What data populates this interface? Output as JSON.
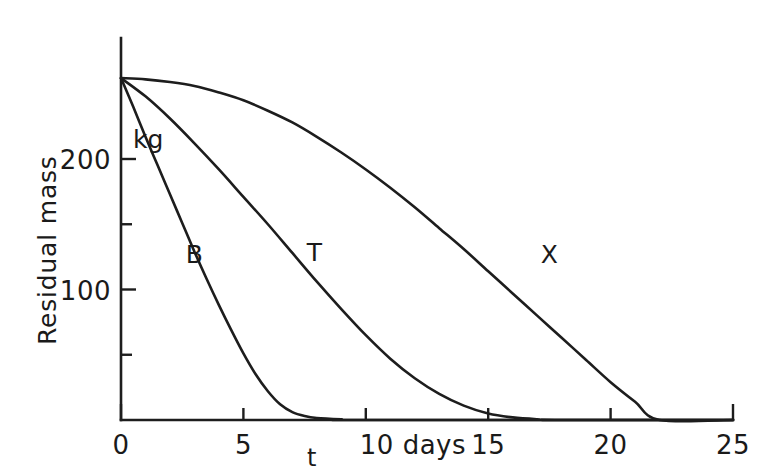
{
  "chart_data": {
    "type": "line",
    "title": "",
    "subtitle": "",
    "xlabel": "t",
    "xunit": "days",
    "ylabel": "Residual mass",
    "yunit": "kg",
    "xlim": [
      0,
      25
    ],
    "ylim": [
      0,
      270
    ],
    "grid": false,
    "legend_position": "inline-curve-labels",
    "xticks": [
      0,
      5,
      10,
      15,
      20,
      25
    ],
    "xtick_labels": [
      "0",
      "5",
      "10 days",
      "15",
      "20",
      "25"
    ],
    "yticks": [
      0,
      50,
      100,
      150,
      200
    ],
    "ytick_labels": [
      "",
      "",
      "100",
      "",
      "200"
    ],
    "annotations": [
      {
        "text": "kg",
        "x": 0,
        "y": 200
      },
      {
        "text": "t",
        "x": 7.6,
        "y": -22
      }
    ],
    "series": [
      {
        "name": "B",
        "label": "B",
        "label_x": 3.0,
        "label_y": 120,
        "x": [
          0,
          0.5,
          1,
          1.5,
          2,
          2.5,
          3,
          3.5,
          4,
          4.5,
          5,
          5.5,
          6,
          6.5,
          7,
          7.5,
          8,
          9,
          10,
          25
        ],
        "y": [
          262,
          240,
          217,
          195,
          173,
          151,
          129,
          108,
          88,
          69,
          51,
          35,
          22,
          12,
          6,
          3,
          1.5,
          0.5,
          0,
          0
        ]
      },
      {
        "name": "T",
        "label": "T",
        "label_x": 7.9,
        "label_y": 122,
        "x": [
          0,
          1,
          2,
          3,
          4,
          5,
          6,
          7,
          8,
          9,
          10,
          11,
          12,
          13,
          14,
          15,
          16,
          17,
          18,
          25
        ],
        "y": [
          262,
          248,
          231,
          212,
          192,
          171,
          150,
          128,
          106,
          85,
          65,
          47,
          32,
          20,
          11,
          5,
          2,
          0.6,
          0,
          0
        ]
      },
      {
        "name": "X",
        "label": "X",
        "label_x": 17.5,
        "label_y": 120,
        "x": [
          0,
          1,
          2,
          3,
          4,
          5,
          6,
          7,
          8,
          9,
          10,
          11,
          12,
          13,
          14,
          15,
          16,
          17,
          18,
          19,
          20,
          21,
          22,
          25
        ],
        "y": [
          262,
          261,
          259,
          256,
          251,
          245,
          237,
          228,
          217,
          205,
          192,
          178,
          163,
          147,
          131,
          114,
          97,
          80,
          63,
          46,
          29,
          14,
          0,
          0
        ]
      }
    ]
  },
  "axes": {
    "y_title": "Residual mass",
    "x_var": "t",
    "y_unit": "kg"
  }
}
